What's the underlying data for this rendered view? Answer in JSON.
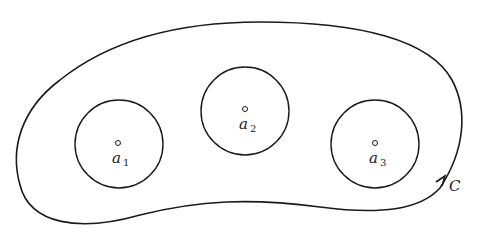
{
  "diagram": {
    "contour": {
      "label": "C",
      "color": "#1a1a1a"
    },
    "points": [
      {
        "name": "a",
        "subscript": "1"
      },
      {
        "name": "a",
        "subscript": "2"
      },
      {
        "name": "a",
        "subscript": "3"
      }
    ]
  }
}
